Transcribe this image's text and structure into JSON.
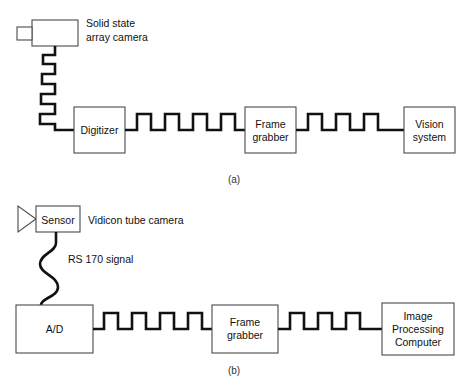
{
  "figure": {
    "captions": {
      "a": "(a)",
      "b": "(b)"
    }
  },
  "colors": {
    "background": "#ffffff",
    "wire": "#111111",
    "box_stroke": "#4a4a4a",
    "text": "#111111",
    "caption_text": "#333333"
  },
  "part_a": {
    "camera": {
      "icon": "solid-state-camera-icon",
      "label_line1": "Solid state",
      "label_line2": "array camera"
    },
    "cable": {
      "icon": "square-zigzag-cable-icon",
      "style": "square-wave"
    },
    "blocks": [
      {
        "id": "digitizer",
        "label_line1": "Digitizer",
        "label_line2": ""
      },
      {
        "id": "frame-grabber",
        "label_line1": "Frame",
        "label_line2": "grabber"
      },
      {
        "id": "vision-system",
        "label_line1": "Vision",
        "label_line2": "system"
      }
    ],
    "signals": [
      {
        "id": "digitizer-to-frame-grabber",
        "icon": "square-wave-signal-icon",
        "pulses": 4
      },
      {
        "id": "frame-grabber-to-vision-system",
        "icon": "square-wave-signal-icon",
        "pulses": 3
      }
    ]
  },
  "part_b": {
    "camera": {
      "icon": "vidicon-tube-camera-icon",
      "sensor_label": "Sensor",
      "label": "Vidicon tube camera"
    },
    "cable": {
      "icon": "sine-wave-cable-icon",
      "style": "sine-wave",
      "label": "RS 170 signal"
    },
    "blocks": [
      {
        "id": "analog-to-digital",
        "label_line1": "A/D",
        "label_line2": "",
        "label_line3": ""
      },
      {
        "id": "frame-grabber",
        "label_line1": "Frame",
        "label_line2": "grabber",
        "label_line3": ""
      },
      {
        "id": "image-processing-computer",
        "label_line1": "Image",
        "label_line2": "Processing",
        "label_line3": "Computer"
      }
    ],
    "signals": [
      {
        "id": "ad-to-frame-grabber",
        "icon": "square-wave-signal-icon",
        "pulses": 4
      },
      {
        "id": "frame-grabber-to-computer",
        "icon": "square-wave-signal-icon",
        "pulses": 3
      }
    ]
  }
}
